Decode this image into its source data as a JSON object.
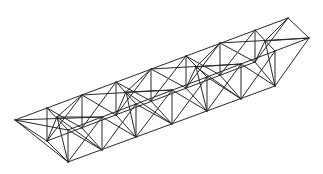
{
  "figure": {
    "stroke_color": "#2a2a2a",
    "background": "#ffffff",
    "bays": 7
  },
  "nodes": {
    "back_top": [
      [
        15,
        120
      ],
      [
        47,
        108
      ],
      [
        82,
        95
      ],
      [
        116,
        82
      ],
      [
        151,
        69
      ],
      [
        186,
        56
      ],
      [
        220,
        43
      ],
      [
        255,
        30
      ],
      [
        288,
        18
      ]
    ],
    "back_bottom": [
      [
        47,
        141
      ],
      [
        82,
        128
      ],
      [
        116,
        115
      ],
      [
        151,
        101
      ],
      [
        186,
        88
      ],
      [
        220,
        75
      ],
      [
        255,
        62
      ]
    ],
    "front_top": [
      [
        68,
        130
      ],
      [
        102,
        117
      ],
      [
        136,
        104
      ],
      [
        172,
        90
      ],
      [
        207,
        77
      ],
      [
        241,
        64
      ],
      [
        275,
        51
      ],
      [
        309,
        38
      ]
    ],
    "front_bottom": [
      [
        68,
        162
      ],
      [
        102,
        150
      ],
      [
        136,
        137
      ],
      [
        172,
        124
      ],
      [
        207,
        111
      ],
      [
        241,
        99
      ],
      [
        275,
        86
      ]
    ],
    "top_centers": [
      [
        57,
        117
      ],
      [
        126,
        92
      ],
      [
        196,
        67
      ],
      [
        265,
        41
      ]
    ]
  }
}
